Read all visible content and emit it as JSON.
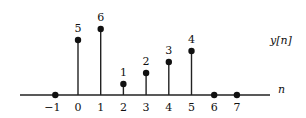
{
  "chart_data": {
    "type": "stem",
    "title": "",
    "signal_label": "y[n]",
    "xlabel": "n",
    "ylabel": "",
    "x": [
      -1,
      0,
      1,
      2,
      3,
      4,
      5,
      6,
      7
    ],
    "values": [
      0,
      5,
      6,
      1,
      2,
      3,
      4,
      0,
      0
    ],
    "value_labels": [
      "",
      "5",
      "6",
      "1",
      "2",
      "3",
      "4",
      "",
      ""
    ],
    "tick_labels": [
      "−1",
      "0",
      "1",
      "2",
      "3",
      "4",
      "5",
      "6",
      "7"
    ],
    "grid": false
  }
}
